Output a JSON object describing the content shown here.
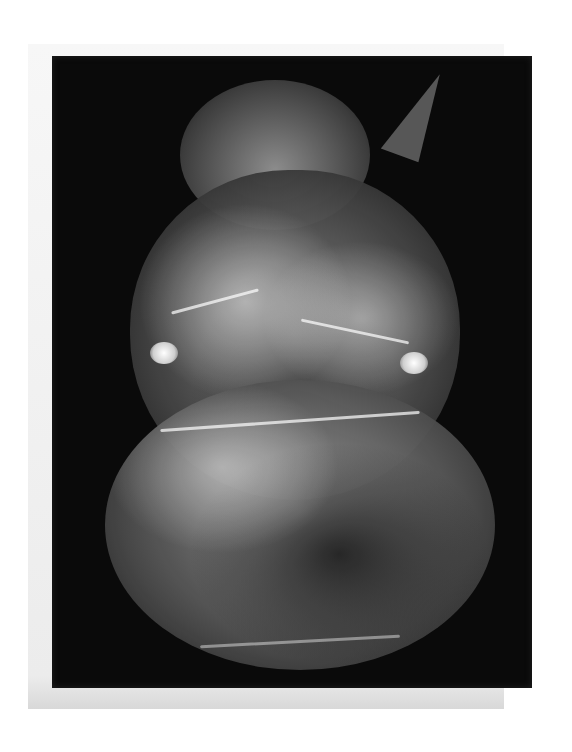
{
  "artwork": {
    "subject": "crumpled transparent plastic bag drawing",
    "colors": {
      "page_background": "#ffffff",
      "paper": "#f0f0f0",
      "board": "#0a0a0a",
      "bag_light": "#e8e8e8",
      "bag_mid": "#7a7a7a"
    }
  }
}
